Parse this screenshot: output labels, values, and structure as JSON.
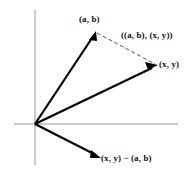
{
  "figure": {
    "type": "vector-diagram",
    "background_color": "#ffffff",
    "axis_color": "#999999",
    "vector_color": "#000000",
    "dashed_color": "#555555",
    "text_color": "#101010",
    "origin": {
      "x": 35,
      "y": 124
    },
    "axes": {
      "x_axis": {
        "x1": 14,
        "y1": 124,
        "x2": 178,
        "y2": 124
      },
      "y_axis": {
        "x1": 35,
        "y1": 10,
        "x2": 35,
        "y2": 165
      }
    },
    "vectors": [
      {
        "name": "vector-ab",
        "label": "(a, b)",
        "from": {
          "x": 35,
          "y": 124
        },
        "to": {
          "x": 96,
          "y": 32
        },
        "style": "solid",
        "arrowhead": true
      },
      {
        "name": "vector-xy",
        "label": "(x, y)",
        "from": {
          "x": 35,
          "y": 124
        },
        "to": {
          "x": 157,
          "y": 66
        },
        "style": "solid",
        "arrowhead": true
      },
      {
        "name": "vector-difference",
        "label": "(x, y) − (a, b)",
        "from": {
          "x": 35,
          "y": 124
        },
        "to": {
          "x": 101,
          "y": 158
        },
        "style": "solid",
        "arrowhead": true
      },
      {
        "name": "segment-inner-product",
        "label": "((a, b), (x, y))",
        "from": {
          "x": 96,
          "y": 32
        },
        "to": {
          "x": 155,
          "y": 64
        },
        "style": "dashed",
        "arrowhead": false
      }
    ],
    "labels": {
      "point_ab": "(a, b)",
      "inner_product": "((a, b), (x, y))",
      "point_xy": "(x, y)",
      "difference": "(x, y) − (a, b)"
    }
  }
}
